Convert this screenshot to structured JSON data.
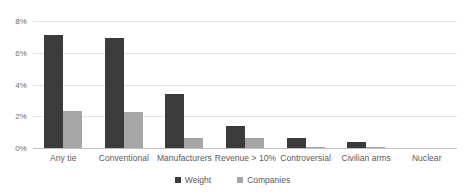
{
  "chart_data": {
    "type": "bar",
    "title": "",
    "subtitle": "",
    "xlabel": "",
    "ylabel": "",
    "ylim": [
      0,
      8
    ],
    "ytick_labels": [
      "0%",
      "2%",
      "4%",
      "6%",
      "8%"
    ],
    "ytick_values": [
      0,
      2,
      4,
      6,
      8
    ],
    "grid": true,
    "legend_position": "bottom",
    "categories": [
      "Any tie",
      "Conventional",
      "Manufacturers",
      "Revenue > 10%",
      "Controversial",
      "Civilian arms",
      "Nuclear"
    ],
    "series": [
      {
        "name": "Weight",
        "color": "#3b3b3b",
        "values": [
          7.1,
          6.9,
          3.4,
          1.4,
          0.6,
          0.4,
          0.0
        ]
      },
      {
        "name": "Companies",
        "color": "#a6a6a6",
        "values": [
          2.35,
          2.3,
          0.65,
          0.65,
          0.05,
          0.07,
          0.0
        ]
      }
    ]
  },
  "legend": {
    "items": [
      {
        "label": "Weight",
        "color": "#3b3b3b"
      },
      {
        "label": "Companies",
        "color": "#a6a6a6"
      }
    ]
  },
  "colors": {
    "weight": "#3b3b3b",
    "companies": "#a6a6a6",
    "gridline": "#e4e4e4",
    "axis": "#bfbfbf",
    "text": "#595959",
    "background": "#ffffff"
  }
}
